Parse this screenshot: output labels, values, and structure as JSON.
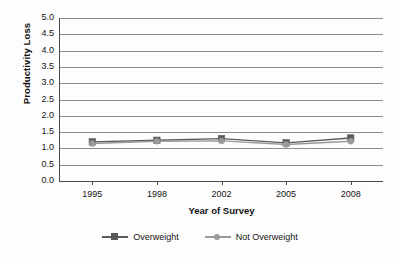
{
  "chart_data": {
    "type": "line",
    "title": "",
    "xlabel": "Year of Survey",
    "ylabel": "Productivity Loss",
    "categories": [
      "1995",
      "1998",
      "2002",
      "2005",
      "2008"
    ],
    "series": [
      {
        "name": "Overweight",
        "marker": "square",
        "color": "#5a5a5a",
        "values": [
          1.2,
          1.25,
          1.3,
          1.17,
          1.32
        ]
      },
      {
        "name": "Not Overweight",
        "marker": "circle",
        "color": "#9a9a9a",
        "values": [
          1.15,
          1.22,
          1.23,
          1.12,
          1.22
        ]
      }
    ],
    "ylim": [
      0.0,
      5.0
    ],
    "ytick_step": 0.5,
    "ytick_labels": [
      "0.0",
      "0.5",
      "1.0",
      "1.5",
      "2.0",
      "2.5",
      "3.0",
      "3.5",
      "4.0",
      "4.5",
      "5.0"
    ],
    "grid": "horizontal",
    "legend_position": "bottom",
    "gridline_color": "#8d8d8d",
    "axis_color": "#4a4a4a",
    "background": "#fdfdfd"
  }
}
